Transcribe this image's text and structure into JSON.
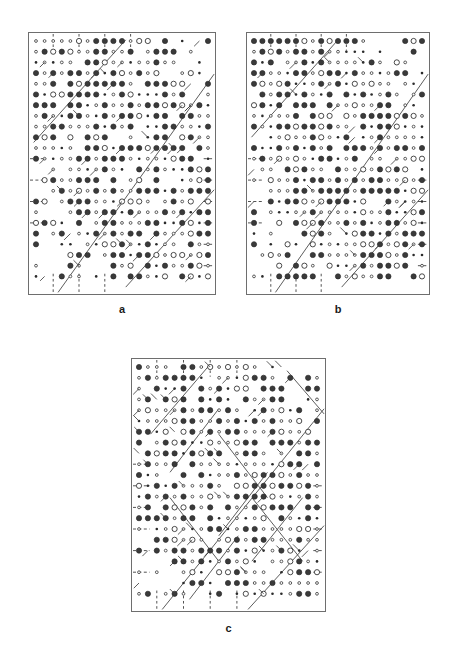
{
  "figure": {
    "kind": "crystallographic-space-group-symmetry-diagrams",
    "background_color": "#ffffff",
    "frame_color": "#6e6e6e",
    "symbol_color": "#2b2b2b",
    "symbol_fill_dark": "#3a3a3a",
    "symbol_fill_open": "#ffffff",
    "line_color": "#404040"
  },
  "panels": [
    {
      "id": "a",
      "label": "a",
      "rect": {
        "x": 28,
        "y": 32,
        "w": 188,
        "h": 263
      },
      "label_pos": {
        "x": 28,
        "y": 303
      },
      "grid": {
        "cols": 21,
        "rows": 23,
        "pitch_x": 8.6,
        "pitch_y": 10.7,
        "origin_x": 8,
        "origin_y": 9
      },
      "seed": 11,
      "diagonals": [
        {
          "x1": 0.03,
          "y1": 0.42,
          "x2": 0.52,
          "y2": 0.03
        },
        {
          "x1": 0.16,
          "y1": 0.99,
          "x2": 0.99,
          "y2": 0.16
        },
        {
          "x1": 0.52,
          "y1": 0.97,
          "x2": 0.99,
          "y2": 0.6
        }
      ],
      "diag_ticks": 46,
      "dashed_left_rows": [
        11,
        13,
        15,
        17
      ],
      "dashed_right_rows": [
        11,
        13,
        15,
        17,
        19,
        21
      ],
      "dashed_top_cols": [
        2,
        5,
        8,
        11
      ],
      "dashed_bottom_cols": [
        2,
        5,
        8
      ]
    },
    {
      "id": "b",
      "label": "b",
      "rect": {
        "x": 246,
        "y": 32,
        "w": 184,
        "h": 263
      },
      "label_pos": {
        "x": 246,
        "y": 303
      },
      "grid": {
        "cols": 21,
        "rows": 23,
        "pitch_x": 8.4,
        "pitch_y": 10.7,
        "origin_x": 8,
        "origin_y": 9
      },
      "seed": 29,
      "diagonals": [
        {
          "x1": 0.03,
          "y1": 0.4,
          "x2": 0.5,
          "y2": 0.03
        },
        {
          "x1": 0.16,
          "y1": 0.99,
          "x2": 0.99,
          "y2": 0.16
        },
        {
          "x1": 0.52,
          "y1": 0.97,
          "x2": 0.99,
          "y2": 0.6
        }
      ],
      "diag_ticks": 34,
      "dashed_left_rows": [
        11,
        13,
        15,
        17
      ],
      "dashed_right_rows": [
        13,
        15,
        17,
        19,
        21
      ],
      "dashed_top_cols": [
        2,
        5,
        8,
        11
      ],
      "dashed_bottom_cols": [
        2,
        5,
        8
      ]
    },
    {
      "id": "c",
      "label": "c",
      "rect": {
        "x": 131,
        "y": 358,
        "w": 195,
        "h": 254
      },
      "label_pos": {
        "x": 131,
        "y": 622
      },
      "grid": {
        "cols": 21,
        "rows": 22,
        "pitch_x": 8.9,
        "pitch_y": 10.8,
        "origin_x": 8,
        "origin_y": 9
      },
      "seed": 47,
      "diagonals": [
        {
          "x1": 0.1,
          "y1": 0.3,
          "x2": 0.4,
          "y2": 0.03
        },
        {
          "x1": 0.16,
          "y1": 0.99,
          "x2": 0.99,
          "y2": 0.2
        },
        {
          "x1": 0.6,
          "y1": 0.99,
          "x2": 0.99,
          "y2": 0.66
        },
        {
          "x1": 0.8,
          "y1": 0.05,
          "x2": 0.99,
          "y2": 0.22
        },
        {
          "x1": 0.2,
          "y1": 0.45,
          "x2": 0.45,
          "y2": 0.2
        },
        {
          "x1": 0.3,
          "y1": 0.95,
          "x2": 0.55,
          "y2": 0.7
        },
        {
          "x1": 0.45,
          "y1": 0.7,
          "x2": 0.7,
          "y2": 0.45
        },
        {
          "x1": 0.2,
          "y1": 0.55,
          "x2": 0.45,
          "y2": 0.8
        },
        {
          "x1": 0.45,
          "y1": 0.3,
          "x2": 0.7,
          "y2": 0.55
        },
        {
          "x1": 0.62,
          "y1": 0.55,
          "x2": 0.88,
          "y2": 0.8
        },
        {
          "x1": 0.62,
          "y1": 0.8,
          "x2": 0.88,
          "y2": 0.55
        }
      ],
      "diag_ticks": 58,
      "dashed_left_rows": [
        9,
        11,
        13,
        15,
        17,
        19
      ],
      "dashed_right_rows": [
        11,
        13,
        15,
        17,
        19
      ],
      "dashed_top_cols": [
        2,
        5,
        8,
        11
      ],
      "dashed_bottom_cols": [
        2,
        5,
        8,
        11
      ]
    }
  ],
  "symbols": {
    "large_filled": {
      "name": "two-fold-rotation-filled",
      "r": 2.6
    },
    "large_open": {
      "name": "two-fold-rotation-open",
      "r": 2.6
    },
    "small_open": {
      "name": "inversion-centre-open",
      "r": 1.4
    },
    "small_filled": {
      "name": "inversion-centre-filled",
      "r": 1.3
    }
  }
}
